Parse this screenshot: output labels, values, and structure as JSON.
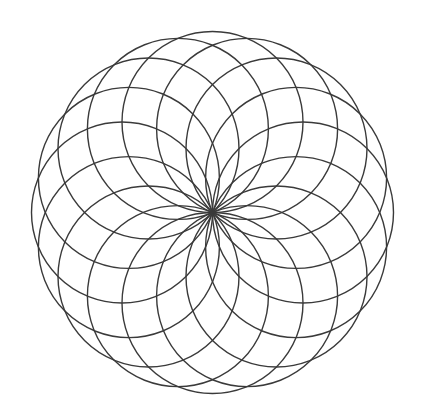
{
  "figure": {
    "kind": "rosette",
    "background_color": "#ffffff",
    "stroke_color": "#3a3a3a",
    "stroke_width": 1.4,
    "canvas": {
      "width": 424,
      "height": 416
    }
  },
  "chart_data": {
    "type": "scatter",
    "subtitle": "",
    "xlabel": "",
    "ylabel": "",
    "xlim": [
      0,
      424
    ],
    "ylim": [
      0,
      416
    ],
    "grid": false,
    "legend": "none",
    "construction": {
      "center_x": 212.5,
      "center_y": 212.5,
      "circle_count": 16,
      "circle_radius": 90.5,
      "ring_radius": 90.5,
      "start_angle_deg": -90,
      "angle_step_deg": 22.5,
      "outer_boundary_radius": 181,
      "petal_count": 16,
      "bounds": {
        "left": 33,
        "right": 392,
        "top": 31,
        "bottom": 394
      }
    },
    "series": [
      {
        "name": "circles",
        "radius": 90.5,
        "centers": [
          {
            "index": 1,
            "angle_deg": -90.0,
            "cx": 212.5,
            "cy": 122.0
          },
          {
            "index": 2,
            "angle_deg": -67.5,
            "cx": 247.1,
            "cy": 128.9
          },
          {
            "index": 3,
            "angle_deg": -45.0,
            "cx": 276.5,
            "cy": 148.5
          },
          {
            "index": 4,
            "angle_deg": -22.5,
            "cx": 296.1,
            "cy": 177.9
          },
          {
            "index": 5,
            "angle_deg": 0.0,
            "cx": 303.0,
            "cy": 212.5
          },
          {
            "index": 6,
            "angle_deg": 22.5,
            "cx": 296.1,
            "cy": 247.1
          },
          {
            "index": 7,
            "angle_deg": 45.0,
            "cx": 276.5,
            "cy": 276.5
          },
          {
            "index": 8,
            "angle_deg": 67.5,
            "cx": 247.1,
            "cy": 296.1
          },
          {
            "index": 9,
            "angle_deg": 90.0,
            "cx": 212.5,
            "cy": 303.0
          },
          {
            "index": 10,
            "angle_deg": 112.5,
            "cx": 177.9,
            "cy": 296.1
          },
          {
            "index": 11,
            "angle_deg": 135.0,
            "cx": 148.5,
            "cy": 276.5
          },
          {
            "index": 12,
            "angle_deg": 157.5,
            "cx": 128.9,
            "cy": 247.1
          },
          {
            "index": 13,
            "angle_deg": 180.0,
            "cx": 122.0,
            "cy": 212.5
          },
          {
            "index": 14,
            "angle_deg": 202.5,
            "cx": 128.9,
            "cy": 177.9
          },
          {
            "index": 15,
            "angle_deg": 225.0,
            "cx": 148.5,
            "cy": 148.5
          },
          {
            "index": 16,
            "angle_deg": 247.5,
            "cx": 177.9,
            "cy": 128.9
          }
        ]
      }
    ],
    "annotations": []
  }
}
